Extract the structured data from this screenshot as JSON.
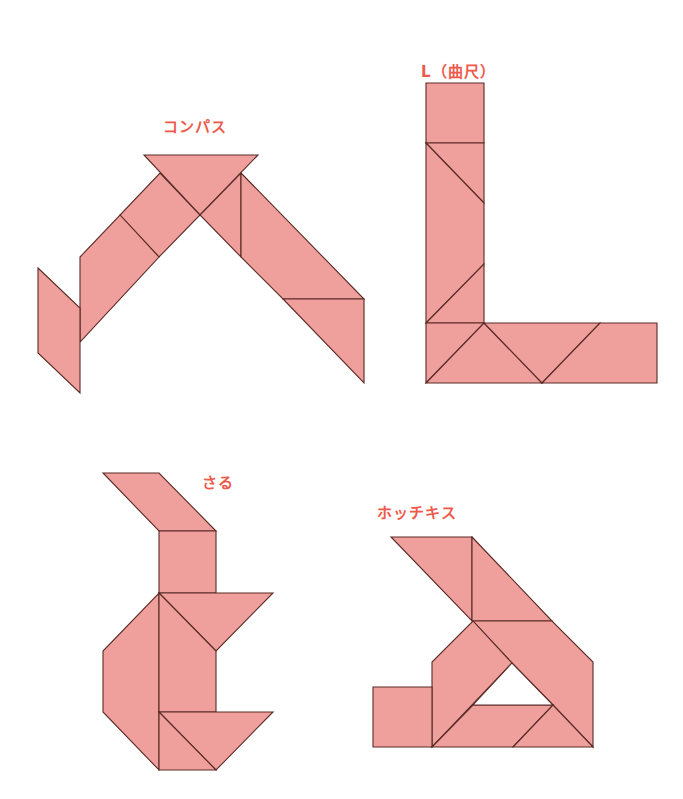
{
  "colors": {
    "piece_fill": "#f0a09c",
    "piece_stroke": "#5a2a26",
    "label": "#ee5a4c",
    "background": "#ffffff"
  },
  "figures": [
    {
      "id": "compass",
      "label": "コンパス",
      "label_pos": [
        163,
        132
      ],
      "pieces": [
        {
          "name": "top-large-triangle",
          "points": "144,155 258,155 200,215"
        },
        {
          "name": "left-arm-upper-square-part",
          "points": "160,173 200,215 159,257 120,215"
        },
        {
          "name": "left-arm-lower-large-triangle",
          "points": "120,215 159,257 80,342 80,257"
        },
        {
          "name": "left-parallelogram",
          "points": "38,268 80,308 80,393 38,353"
        },
        {
          "name": "right-small-triangle",
          "points": "241,173 241,257 200,215"
        },
        {
          "name": "right-large-triangle",
          "points": "241,173 364,299 283,299 241,257"
        },
        {
          "name": "right-bottom-triangle",
          "points": "283,299 364,299 364,383"
        }
      ]
    },
    {
      "id": "l-square",
      "label": "L（曲尺）",
      "label_pos": [
        421,
        77
      ],
      "pieces": [
        {
          "name": "top-square",
          "points": "426,83 484,83 484,143 426,143"
        },
        {
          "name": "upper-triangle",
          "points": "426,143 484,143 484,203"
        },
        {
          "name": "middle-quad",
          "points": "426,143 484,203 484,264 426,323"
        },
        {
          "name": "lower-triangle",
          "points": "484,264 484,323 426,323"
        },
        {
          "name": "bottom-left-triangle",
          "points": "426,323 484,323 426,383"
        },
        {
          "name": "bottom-large-triangle",
          "points": "426,383 484,323 542,383"
        },
        {
          "name": "bottom-middle-triangle",
          "points": "484,323 600,323 542,383"
        },
        {
          "name": "bottom-right-trapezoid",
          "points": "600,323 657,323 657,383 542,383"
        }
      ]
    },
    {
      "id": "monkey",
      "label": "さる",
      "label_pos": [
        202,
        488
      ],
      "pieces": [
        {
          "name": "head-parallelogram",
          "points": "103,473 159,473 216,531 159,531"
        },
        {
          "name": "neck-square",
          "points": "159,531 216,531 216,593 159,593"
        },
        {
          "name": "head-right-triangle",
          "points": "159,593 273,593 216,651"
        },
        {
          "name": "body-left",
          "points": "159,593 159,770 103,712 103,651"
        },
        {
          "name": "body-right",
          "points": "159,593 216,651 216,712 159,712"
        },
        {
          "name": "bottom-right-triangle",
          "points": "159,712 273,712 216,770"
        },
        {
          "name": "bottom-left-triangle",
          "points": "159,712 216,770 159,770"
        }
      ]
    },
    {
      "id": "stapler",
      "label": "ホッチキス",
      "label_pos": [
        377,
        518
      ],
      "pieces": [
        {
          "name": "top-left-triangle",
          "points": "391,537 472,537 472,621"
        },
        {
          "name": "top-right-triangle",
          "points": "472,537 552,621 472,621"
        },
        {
          "name": "right-side",
          "points": "473,621 552,621 593,662 593,747 553,705 512,663"
        },
        {
          "name": "left-parallelogram",
          "points": "473,621 512,663 432,747 432,662"
        },
        {
          "name": "left-square",
          "points": "373,687 432,687 432,747 373,747"
        },
        {
          "name": "bottom-middle",
          "points": "432,747 473,705 553,705 513,747"
        },
        {
          "name": "bottom-right-triangle",
          "points": "513,747 553,705 593,747"
        }
      ],
      "hole": "512,663 473,705 553,705"
    }
  ]
}
